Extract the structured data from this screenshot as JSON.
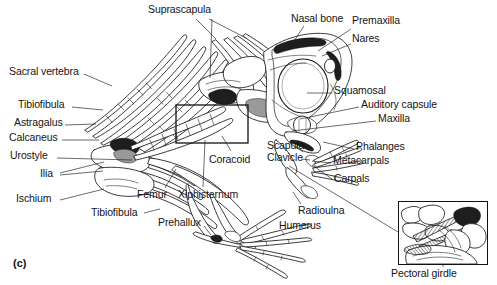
{
  "figure": {
    "caption": "(c)",
    "inset_caption": "Pectoral girdle"
  },
  "labels": [
    {
      "id": "suprascapula",
      "text": "Suprascapula",
      "x": 148,
      "y": 4,
      "align": "left"
    },
    {
      "id": "nasal-bone",
      "text": "Nasal bone",
      "x": 291,
      "y": 13,
      "align": "left"
    },
    {
      "id": "premaxilla",
      "text": "Premaxilla",
      "x": 352,
      "y": 15,
      "align": "left"
    },
    {
      "id": "nares",
      "text": "Nares",
      "x": 352,
      "y": 33,
      "align": "left"
    },
    {
      "id": "sacral-vertebra",
      "text": "Sacral vertebra",
      "x": 9,
      "y": 66,
      "align": "left"
    },
    {
      "id": "squamosal",
      "text": "Squamosal",
      "x": 334,
      "y": 85,
      "align": "left"
    },
    {
      "id": "tibiofibula-1",
      "text": "Tibiofibula",
      "x": 18,
      "y": 99,
      "align": "left"
    },
    {
      "id": "auditory-capsule",
      "text": "Auditory capsule",
      "x": 361,
      "y": 99,
      "align": "left"
    },
    {
      "id": "astragalus",
      "text": "Astragalus",
      "x": 14,
      "y": 117,
      "align": "left"
    },
    {
      "id": "maxilla",
      "text": "Maxilla",
      "x": 378,
      "y": 113,
      "align": "left"
    },
    {
      "id": "calcaneus",
      "text": "Calcaneus",
      "x": 9,
      "y": 132,
      "align": "left"
    },
    {
      "id": "scapula",
      "text": "Scapula",
      "x": 267,
      "y": 140,
      "align": "left"
    },
    {
      "id": "phalanges",
      "text": "Phalanges",
      "x": 356,
      "y": 141,
      "align": "left"
    },
    {
      "id": "urostyle",
      "text": "Urostyle",
      "x": 10,
      "y": 150,
      "align": "left"
    },
    {
      "id": "clavicle",
      "text": "Clavicle",
      "x": 267,
      "y": 152,
      "align": "left"
    },
    {
      "id": "metacarpals",
      "text": "Metacarpals",
      "x": 333,
      "y": 155,
      "align": "left"
    },
    {
      "id": "coracoid",
      "text": "Coracoid",
      "x": 209,
      "y": 154,
      "align": "left"
    },
    {
      "id": "ilia",
      "text": "Ilia",
      "x": 40,
      "y": 168,
      "align": "left"
    },
    {
      "id": "carpals",
      "text": "Carpals",
      "x": 334,
      "y": 173,
      "align": "left"
    },
    {
      "id": "ischium",
      "text": "Ischium",
      "x": 16,
      "y": 193,
      "align": "left"
    },
    {
      "id": "femur",
      "text": "Femur",
      "x": 137,
      "y": 189,
      "align": "left"
    },
    {
      "id": "xiphisternum",
      "text": "Xiphisternum",
      "x": 178,
      "y": 189,
      "align": "left"
    },
    {
      "id": "tibiofibula-2",
      "text": "Tibiofibula",
      "x": 91,
      "y": 207,
      "align": "left"
    },
    {
      "id": "radioulna",
      "text": "Radioulna",
      "x": 298,
      "y": 205,
      "align": "left"
    },
    {
      "id": "prehallux",
      "text": "Prehallux",
      "x": 158,
      "y": 217,
      "align": "left"
    },
    {
      "id": "humerus",
      "text": "Humerus",
      "x": 279,
      "y": 220,
      "align": "left"
    }
  ],
  "leaders": [
    {
      "id": "suprascapula-a",
      "d": "M196,19 L216,39"
    },
    {
      "id": "suprascapula-b",
      "d": "M209,19 L246,38"
    },
    {
      "id": "suprascapula-c",
      "d": "M212,19 L210,78"
    },
    {
      "id": "nasal-bone",
      "d": "M304,26 L292,44"
    },
    {
      "id": "premaxilla",
      "d": "M351,29 L318,51"
    },
    {
      "id": "nares",
      "d": "M351,44 L322,56"
    },
    {
      "id": "sacral-vertebra",
      "d": "M84,74 L112,86"
    },
    {
      "id": "squamosal",
      "d": "M332,93 L307,93"
    },
    {
      "id": "tibiofibula-1",
      "d": "M72,107 L103,110"
    },
    {
      "id": "auditory-capsule",
      "d": "M359,107 L300,119"
    },
    {
      "id": "astragalus",
      "d": "M65,125 L96,124"
    },
    {
      "id": "maxilla",
      "d": "M376,121 L292,131"
    },
    {
      "id": "calcaneus",
      "d": "M62,140 L99,140"
    },
    {
      "id": "scapula",
      "d": "M296,146 L303,152"
    },
    {
      "id": "phalanges",
      "d": "M354,149 L323,142"
    },
    {
      "id": "urostyle",
      "d": "M57,158 L132,160"
    },
    {
      "id": "clavicle",
      "d": "M301,159 L310,160"
    },
    {
      "id": "metacarpals",
      "d": "M331,163 L312,161"
    },
    {
      "id": "coracoid",
      "d": "M231,151 L222,136"
    },
    {
      "id": "ilia-a",
      "d": "M60,173 L104,162"
    },
    {
      "id": "ilia-b",
      "d": "M60,175 L103,171"
    },
    {
      "id": "carpals",
      "d": "M332,179 L312,165"
    },
    {
      "id": "ischium",
      "d": "M60,200 L104,189"
    },
    {
      "id": "femur",
      "d": "M165,188 L176,169"
    },
    {
      "id": "xiphisternum",
      "d": "M203,187 L205,140"
    },
    {
      "id": "tibiofibula-2",
      "d": "M144,213 L160,209"
    },
    {
      "id": "radioulna",
      "d": "M301,204 L293,192"
    },
    {
      "id": "prehallux",
      "d": "M204,226 L211,235"
    },
    {
      "id": "inset-link",
      "d": "M289,166 L398,232"
    },
    {
      "id": "inset-caption",
      "d": "M443,245 L443,267"
    }
  ],
  "inset": {
    "x": 398,
    "y": 201,
    "w": 90,
    "h": 64,
    "caption_x": 391,
    "caption_y": 268
  },
  "detail_box": {
    "x": 176,
    "y": 105,
    "w": 72,
    "h": 38
  },
  "colors": {
    "ink": "#1a1a1a",
    "paper": "#ffffff",
    "shading_dark": "#1e1e1e",
    "shading_mid": "#9a9a9a"
  }
}
